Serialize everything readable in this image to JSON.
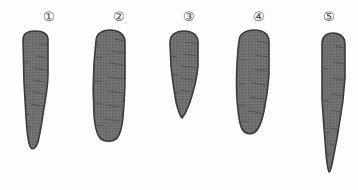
{
  "figure": {
    "background_color": "#fdfdfd",
    "root_fill_color": "#6f6f6f",
    "root_outline_color": "#3a3a3a",
    "label_color": "#4a4a4a",
    "ridge_color": "#4b4b4b",
    "width": 358,
    "height": 190
  },
  "specimens": [
    {
      "label": "①",
      "name": "specimen-1",
      "shape_description": "long tapered conical root with rounded shoulder",
      "label_x": 38,
      "label_y": 10,
      "x": 17,
      "y": 30,
      "w": 36,
      "h": 122,
      "path": "M6,10 C6,4 10,1 18,1 C26,1 31,4 31,10 L31,44 C31,56 29,66 27,78 C25,92 23,104 21,112 C19,118 16,120 14,118 C12,116 11,110 10,100 C9,88 8,70 7,52 Z",
      "ridges": [
        "M22,14 L30,15",
        "M20,26 L30,28",
        "M18,38 L29,40",
        "M17,50 L28,52",
        "M16,62 L27,64",
        "M14,74 L25,76",
        "M7,32 L12,32",
        "M6,56 L11,57",
        "M8,84 L13,85",
        "M9,96 L14,97"
      ],
      "viewbox": "0 0 36 122"
    },
    {
      "label": "②",
      "name": "specimen-2",
      "shape_description": "broad blunt cylindrical root with rounded tip",
      "label_x": 108,
      "label_y": 10,
      "x": 88,
      "y": 29,
      "w": 44,
      "h": 116,
      "path": "M8,12 C8,5 14,1 22,1 C30,1 37,5 37,13 L37,48 C37,62 36,76 35,88 C34,98 32,107 28,110 C24,113 17,113 13,110 C9,107 7,98 6,86 C5,70 5,50 6,34 Z",
      "ridges": [
        "M26,10 L36,12",
        "M24,22 L36,24",
        "M22,34 L35,36",
        "M20,48 L35,50",
        "M19,62 L34,64",
        "M18,76 L33,78",
        "M17,90 L31,92",
        "M8,28 L14,29",
        "M7,52 L13,53",
        "M8,74 L14,75",
        "M9,96 L15,97"
      ],
      "viewbox": "0 0 44 116"
    },
    {
      "label": "③",
      "name": "specimen-3",
      "shape_description": "short broad conical root with pointed tip",
      "label_x": 178,
      "label_y": 10,
      "x": 161,
      "y": 30,
      "w": 44,
      "h": 92,
      "path": "M9,12 C9,5 15,1 23,1 C31,1 37,5 37,12 L37,36 C36,48 33,60 29,72 C26,80 23,86 21,88 C19,86 17,80 15,72 C13,60 11,48 10,36 Z",
      "ridges": [
        "M25,12 L36,14",
        "M23,24 L36,26",
        "M21,36 L35,38",
        "M20,48 L32,50",
        "M19,60 L29,62",
        "M10,26 L15,27",
        "M11,44 L16,45",
        "M13,62 L18,63"
      ],
      "viewbox": "0 0 44 92"
    },
    {
      "label": "④",
      "name": "specimen-4",
      "shape_description": "broad tapered root with rounded shoulder and blunt tip",
      "label_x": 248,
      "label_y": 10,
      "x": 230,
      "y": 29,
      "w": 46,
      "h": 110,
      "path": "M9,12 C9,5 16,1 24,1 C33,1 39,5 39,13 L39,46 C38,60 36,72 34,82 C32,92 29,100 25,103 C21,106 15,105 12,100 C9,94 8,84 7,70 C6,54 7,32 8,20 Z",
      "ridges": [
        "M28,12 L38,14",
        "M26,26 L38,28",
        "M24,40 L37,42",
        "M22,54 L36,56",
        "M20,68 L34,70",
        "M18,82 L31,84",
        "M9,30 L15,31",
        "M8,54 L14,55",
        "M9,76 L15,77",
        "M12,92 L18,93"
      ],
      "viewbox": "0 0 46 110"
    },
    {
      "label": "⑤",
      "name": "specimen-5",
      "shape_description": "very long slender root with sharp pointed tip",
      "label_x": 318,
      "label_y": 10,
      "x": 312,
      "y": 32,
      "w": 38,
      "h": 144,
      "path": "M10,12 C10,5 14,1 21,1 C28,1 33,5 33,12 L33,46 C32,62 30,78 27,94 C25,108 22,122 20,132 C19,137 18,140 17,140 C16,138 15,132 14,122 C13,106 11,86 10,66 Z",
      "ridges": [
        "M24,14 L32,16",
        "M22,30 L32,32",
        "M21,46 L31,48",
        "M20,62 L30,64",
        "M19,78 L28,80",
        "M18,96 L26,98",
        "M17,112 L24,114",
        "M10,36 L15,37",
        "M11,68 L16,69",
        "M12,100 L17,101",
        "M14,122 L18,123"
      ],
      "viewbox": "0 0 38 144"
    }
  ]
}
